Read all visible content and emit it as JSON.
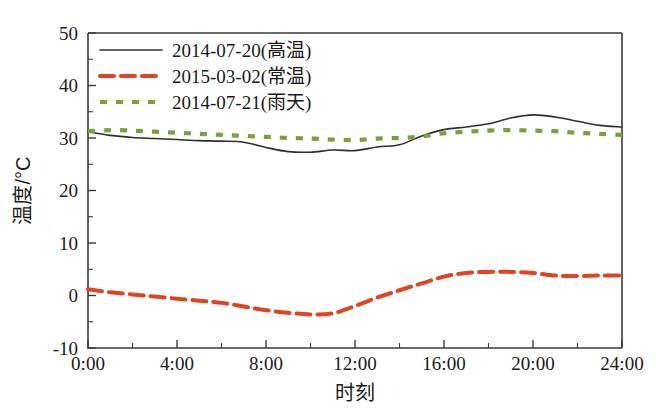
{
  "chart_data": {
    "type": "line",
    "title": "",
    "xlabel": "时刻",
    "ylabel": "温度/°C",
    "xlim": [
      0,
      24
    ],
    "ylim": [
      -10,
      50
    ],
    "grid": false,
    "legend_position": "top-left",
    "x_tick_labels": [
      "0:00",
      "4:00",
      "8:00",
      "12:00",
      "16:00",
      "20:00",
      "24:00"
    ],
    "x_tick_values": [
      0,
      4,
      8,
      12,
      16,
      20,
      24
    ],
    "y_tick_labels": [
      "-10",
      "0",
      "10",
      "20",
      "30",
      "40",
      "50"
    ],
    "y_tick_values": [
      -10,
      0,
      10,
      20,
      30,
      40,
      50
    ],
    "x_minor_step": 2,
    "y_minor_step": 5,
    "x": [
      0,
      1,
      2,
      3,
      4,
      5,
      6,
      7,
      8,
      9,
      10,
      11,
      12,
      13,
      14,
      15,
      16,
      17,
      18,
      19,
      20,
      21,
      22,
      23,
      24
    ],
    "series": [
      {
        "name": "2014-07-20(高温)",
        "style": "solid",
        "color": "#2e2e2e",
        "values": [
          31.2,
          30.5,
          30.1,
          29.9,
          29.7,
          29.5,
          29.4,
          29.2,
          28.2,
          27.4,
          27.3,
          27.7,
          27.6,
          28.3,
          28.7,
          30.4,
          31.6,
          32.1,
          32.7,
          33.8,
          34.4,
          34.0,
          33.2,
          32.4,
          32.1
        ]
      },
      {
        "name": "2015-03-02(常温)",
        "style": "dashed",
        "color": "#e04322",
        "values": [
          1.2,
          0.6,
          0.2,
          -0.2,
          -0.6,
          -1.0,
          -1.4,
          -2.1,
          -2.8,
          -3.3,
          -3.6,
          -3.4,
          -2.0,
          -0.4,
          1.0,
          2.3,
          3.6,
          4.3,
          4.5,
          4.5,
          4.3,
          3.8,
          3.7,
          3.8,
          3.8
        ]
      },
      {
        "name": "2014-07-21(雨天)",
        "style": "dotted",
        "color": "#7e9e3c",
        "values": [
          31.3,
          31.5,
          31.4,
          31.2,
          31.0,
          30.8,
          30.6,
          30.4,
          30.2,
          30.0,
          29.9,
          29.7,
          29.6,
          29.9,
          30.0,
          30.3,
          30.9,
          31.2,
          31.4,
          31.5,
          31.4,
          31.3,
          31.0,
          30.8,
          30.6
        ]
      }
    ]
  }
}
